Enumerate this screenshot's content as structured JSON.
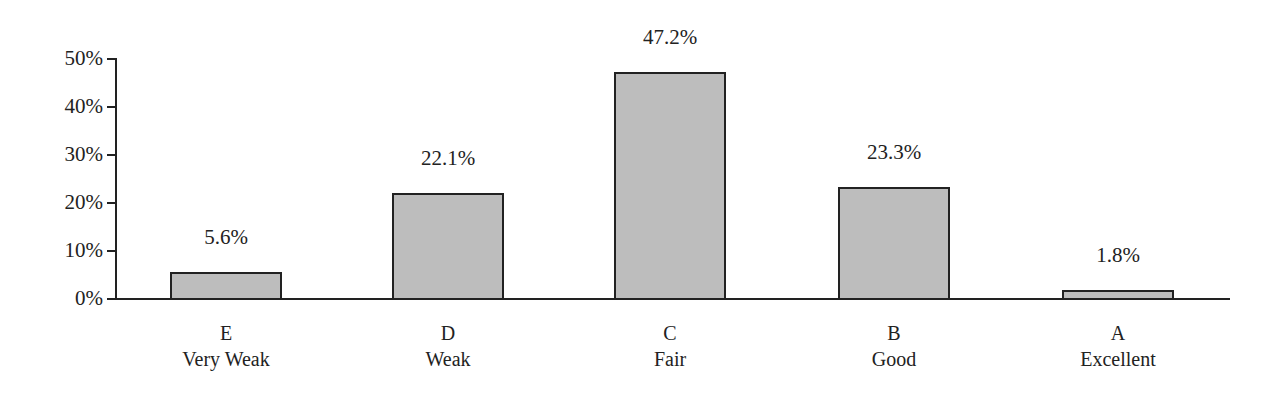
{
  "chart_data": {
    "type": "bar",
    "title": "",
    "xlabel": "",
    "ylabel": "",
    "ylim": [
      0,
      50
    ],
    "yticks": [
      "0%",
      "10%",
      "20%",
      "30%",
      "40%",
      "50%"
    ],
    "categories": [
      "E Very Weak",
      "D Weak",
      "C Fair",
      "B Good",
      "A Excellent"
    ],
    "category_grades": [
      "E",
      "D",
      "C",
      "B",
      "A"
    ],
    "category_names": [
      "Very Weak",
      "Weak",
      "Fair",
      "Good",
      "Excellent"
    ],
    "values": [
      5.6,
      22.1,
      47.2,
      23.3,
      1.8
    ],
    "value_labels": [
      "5.6%",
      "22.1%",
      "47.2%",
      "23.3%",
      "1.8%"
    ],
    "grid": false,
    "legend": "none",
    "bar_color": "#bdbdbd",
    "edge_color": "#222222"
  }
}
